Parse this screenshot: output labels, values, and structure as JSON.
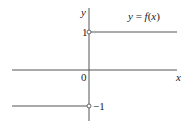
{
  "figure": {
    "title": "y = f(x)",
    "function_label": {
      "y": "y",
      "eq": " = ",
      "f": "f",
      "open": "(",
      "x": "x",
      "close": ")"
    },
    "axes": {
      "x_label": "x",
      "y_label": "y",
      "origin_label": "0"
    },
    "tick_labels": {
      "y_pos_one": "1",
      "y_neg_one": "−1"
    },
    "pieces": [
      {
        "domain": "x > 0",
        "value": 1,
        "endpoint": "open circle at (0, 1)"
      },
      {
        "domain": "x < 0",
        "value": -1,
        "endpoint": "open circle at (0, -1)"
      }
    ],
    "colors": {
      "axis": "#555555",
      "line": "#555555",
      "text": "#222222",
      "background": "#ffffff"
    }
  }
}
